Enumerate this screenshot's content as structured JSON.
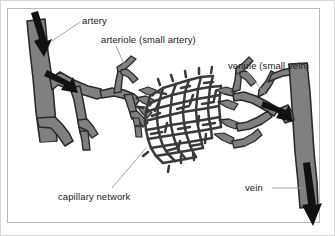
{
  "figure": {
    "background_color": "#ffffff",
    "frame_color": "#b9b9b9",
    "vessel_fill": "#808080",
    "vessel_outline": "#2b2b2b",
    "arrow_color": "#111111",
    "leader_line_color": "#9a9a9a",
    "text_color": "#1b1b1b"
  },
  "labels": {
    "artery": "artery",
    "arteriole": "arteriole (small artery)",
    "venule": "venule (small vein)",
    "capillary": "capillary network",
    "vein": "vein"
  },
  "structures": [
    {
      "name": "artery",
      "side": "left",
      "description": "large gray vessel entering top-left, branching to the right"
    },
    {
      "name": "arteriole",
      "side": "left",
      "description": "smaller branching vessel feeding the capillary bed"
    },
    {
      "name": "capillary-network",
      "side": "center",
      "description": "dense irregular polygonal mesh of fine vessels"
    },
    {
      "name": "venule",
      "side": "right",
      "description": "smaller branching vessel draining the capillary bed"
    },
    {
      "name": "vein",
      "side": "right",
      "description": "large gray vessel exiting bottom-right"
    }
  ],
  "flow_arrows": [
    {
      "name": "artery-inflow-arrow",
      "direction": "down-right",
      "location": "top-left artery"
    },
    {
      "name": "artery-branch-arrow",
      "direction": "right",
      "location": "artery branch junction"
    },
    {
      "name": "vein-inflow-arrow",
      "direction": "right-down",
      "location": "vein junction"
    },
    {
      "name": "vein-outflow-arrow",
      "direction": "down",
      "location": "bottom-right vein exit"
    }
  ]
}
